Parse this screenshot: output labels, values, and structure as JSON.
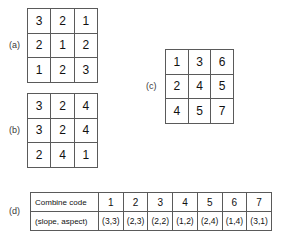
{
  "figure": {
    "panels": [
      {
        "id": "a",
        "label": "(a)",
        "type": "matrix",
        "rows": [
          [
            "3",
            "2",
            "1"
          ],
          [
            "2",
            "1",
            "2"
          ],
          [
            "1",
            "2",
            "3"
          ]
        ]
      },
      {
        "id": "b",
        "label": "(b)",
        "type": "matrix",
        "rows": [
          [
            "3",
            "2",
            "4"
          ],
          [
            "3",
            "2",
            "4"
          ],
          [
            "2",
            "4",
            "1"
          ]
        ]
      },
      {
        "id": "c",
        "label": "(c)",
        "type": "matrix",
        "rows": [
          [
            "1",
            "3",
            "6"
          ],
          [
            "2",
            "4",
            "5"
          ],
          [
            "4",
            "5",
            "7"
          ]
        ]
      },
      {
        "id": "d",
        "label": "(d)",
        "type": "table"
      }
    ]
  },
  "chart_data": {
    "type": "table",
    "title": "",
    "row_headers": [
      "Combine code",
      "(slope, aspect)"
    ],
    "rows": [
      {
        "header": "Combine code",
        "values": [
          "1",
          "2",
          "3",
          "4",
          "5",
          "6",
          "7"
        ]
      },
      {
        "header": "(slope, aspect)",
        "values": [
          "(3,3)",
          "(2,3)",
          "(2,2)",
          "(1,2)",
          "(2,4)",
          "(1,4)",
          "(3,1)"
        ]
      }
    ],
    "matrices": {
      "a": [
        [
          3,
          2,
          1
        ],
        [
          2,
          1,
          2
        ],
        [
          1,
          2,
          3
        ]
      ],
      "b": [
        [
          3,
          2,
          4
        ],
        [
          3,
          2,
          4
        ],
        [
          2,
          4,
          1
        ]
      ],
      "c": [
        [
          1,
          3,
          6
        ],
        [
          2,
          4,
          5
        ],
        [
          4,
          5,
          7
        ]
      ]
    }
  },
  "colors": {
    "background": "#ffffff",
    "border": "#5a5a5a",
    "text": "#111111",
    "label": "#3a3a3a"
  }
}
